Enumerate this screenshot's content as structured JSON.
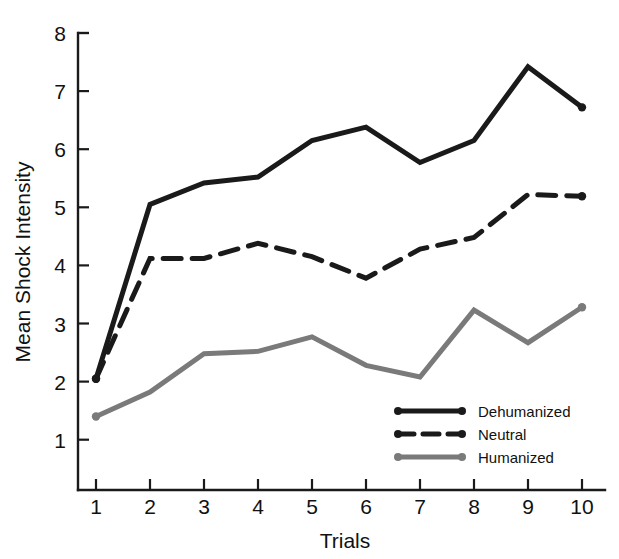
{
  "chart_data": {
    "type": "line",
    "title": "",
    "xlabel": "Trials",
    "ylabel": "Mean Shock Intensity",
    "x": [
      1,
      2,
      3,
      4,
      5,
      6,
      7,
      8,
      9,
      10
    ],
    "categories": [
      "1",
      "2",
      "3",
      "4",
      "5",
      "6",
      "7",
      "8",
      "9",
      "10"
    ],
    "xtick_labels": [
      "1",
      "2",
      "3",
      "4",
      "5",
      "6",
      "7",
      "8",
      "9",
      "10"
    ],
    "ytick_labels": [
      "1",
      "2",
      "3",
      "4",
      "5",
      "6",
      "7",
      "8"
    ],
    "xlim": [
      1,
      10
    ],
    "ylim": [
      0,
      8
    ],
    "grid": false,
    "legend_position": "lower right",
    "series": [
      {
        "name": "Dehumanized",
        "style": "solid",
        "color": "#1a1a1a",
        "values": [
          2.05,
          5.05,
          5.42,
          5.52,
          6.15,
          6.38,
          5.77,
          6.15,
          7.42,
          6.72
        ]
      },
      {
        "name": "Neutral",
        "style": "dashed",
        "color": "#1a1a1a",
        "values": [
          2.05,
          4.12,
          4.12,
          4.38,
          4.15,
          3.78,
          4.28,
          4.48,
          5.22,
          5.19
        ]
      },
      {
        "name": "Humanized",
        "style": "solid",
        "color": "#7a7a7a",
        "values": [
          1.4,
          1.82,
          2.48,
          2.52,
          2.77,
          2.28,
          2.08,
          3.23,
          2.67,
          3.28
        ]
      }
    ]
  },
  "axes": {
    "y_title": "Mean Shock Intensity",
    "x_title": "Trials"
  },
  "legend": {
    "entries": [
      {
        "label": "Dehumanized"
      },
      {
        "label": "Neutral"
      },
      {
        "label": "Humanized"
      }
    ]
  },
  "colors": {
    "dark": "#1a1a1a",
    "gray": "#7a7a7a",
    "background": "#ffffff"
  }
}
